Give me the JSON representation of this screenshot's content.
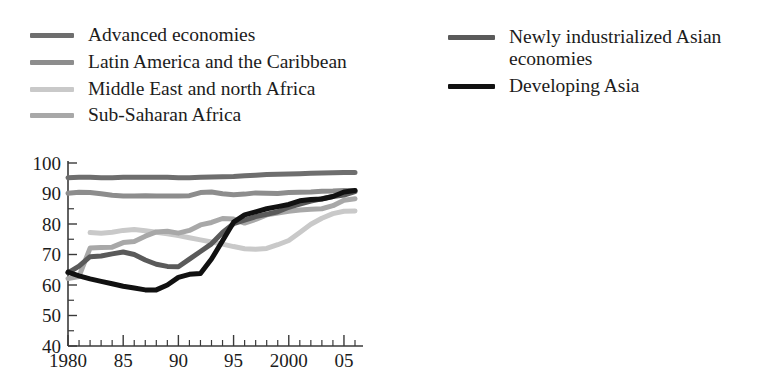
{
  "figure": {
    "title_fragment": "",
    "caption": ""
  },
  "legend": {
    "left_column": [
      {
        "label": "Advanced economies",
        "color": "#6e6e6e",
        "key": "advanced-economies"
      },
      {
        "label": "Latin America and the Caribbean",
        "color": "#8d8d8d",
        "key": "latin-america-caribbean"
      },
      {
        "label": "Middle East and north Africa",
        "color": "#c9c9c9",
        "key": "middle-east-north-africa"
      },
      {
        "label": "Sub-Saharan Africa",
        "color": "#a8a8a8",
        "key": "sub-saharan-africa"
      }
    ],
    "right_column": [
      {
        "label": "Newly industrialized Asian economies",
        "color": "#5a5a5a",
        "key": "newly-industrialized-asian-economies"
      },
      {
        "label": "Developing Asia",
        "color": "#111111",
        "key": "developing-asia"
      }
    ]
  },
  "chart_data": {
    "type": "line",
    "title": "",
    "xlabel": "",
    "ylabel": "",
    "xlim": [
      1980,
      2006
    ],
    "ylim": [
      40,
      100
    ],
    "ytick_labels": [
      "100",
      "90",
      "80",
      "70",
      "60",
      "50",
      "40"
    ],
    "ytick_values": [
      100,
      90,
      80,
      70,
      60,
      50,
      40
    ],
    "yminor_step": 5,
    "xtick_labels": [
      "1980",
      "85",
      "90",
      "95",
      "2000",
      "05"
    ],
    "xtick_values": [
      1980,
      1985,
      1990,
      1995,
      2000,
      2005
    ],
    "xminor_step": 1,
    "grid": false,
    "legend_position": "above-plot",
    "x": [
      1980,
      1981,
      1982,
      1983,
      1984,
      1985,
      1986,
      1987,
      1988,
      1989,
      1990,
      1991,
      1992,
      1993,
      1994,
      1995,
      1996,
      1997,
      1998,
      1999,
      2000,
      2001,
      2002,
      2003,
      2004,
      2005,
      2006
    ],
    "series": [
      {
        "name": "Advanced economies",
        "color": "#6e6e6e",
        "width": 5,
        "values": [
          95.2,
          95.3,
          95.3,
          95.2,
          95.2,
          95.3,
          95.3,
          95.3,
          95.3,
          95.3,
          95.2,
          95.2,
          95.3,
          95.4,
          95.5,
          95.6,
          95.8,
          96.0,
          96.2,
          96.3,
          96.4,
          96.5,
          96.6,
          96.7,
          96.8,
          96.9,
          96.9
        ]
      },
      {
        "name": "Latin America and the Caribbean",
        "color": "#8d8d8d",
        "width": 5,
        "values": [
          90.1,
          90.4,
          90.3,
          89.9,
          89.4,
          89.2,
          89.2,
          89.3,
          89.2,
          89.2,
          89.2,
          89.3,
          90.3,
          90.5,
          89.9,
          89.6,
          89.8,
          90.2,
          90.1,
          90.0,
          90.3,
          90.4,
          90.5,
          90.7,
          90.8,
          91.0,
          91.0
        ]
      },
      {
        "name": "Middle East and north Africa",
        "color": "#c9c9c9",
        "width": 5,
        "values": [
          null,
          null,
          77.2,
          77.0,
          77.3,
          77.9,
          78.2,
          77.8,
          77.3,
          76.8,
          76.2,
          75.5,
          74.8,
          74.1,
          73.4,
          72.6,
          71.9,
          71.7,
          72.0,
          73.2,
          74.6,
          77.2,
          79.9,
          81.9,
          83.4,
          84.2,
          84.3
        ]
      },
      {
        "name": "Sub-Saharan Africa",
        "color": "#a8a8a8",
        "width": 5,
        "values": [
          62.1,
          62.8,
          72.1,
          72.3,
          72.4,
          73.9,
          74.3,
          76.0,
          77.4,
          77.6,
          77.0,
          77.9,
          79.7,
          80.5,
          81.8,
          81.6,
          80.3,
          81.5,
          83.0,
          83.6,
          84.2,
          84.6,
          84.8,
          85.0,
          86.0,
          87.8,
          88.3
        ]
      },
      {
        "name": "Newly industrialized Asian economies",
        "color": "#5a5a5a",
        "width": 5,
        "values": [
          64.0,
          66.2,
          69.3,
          69.5,
          70.2,
          70.8,
          70.0,
          68.2,
          66.8,
          66.1,
          66.0,
          68.5,
          71.0,
          73.5,
          77.2,
          80.1,
          81.3,
          82.4,
          83.2,
          84.0,
          85.5,
          86.5,
          87.5,
          88.3,
          89.0,
          89.5,
          90.6
        ]
      },
      {
        "name": "Developing Asia",
        "color": "#111111",
        "width": 5,
        "values": [
          64.2,
          63.0,
          62.0,
          61.2,
          60.4,
          59.6,
          59.0,
          58.4,
          58.4,
          60.0,
          62.5,
          63.5,
          63.8,
          68.5,
          74.5,
          80.6,
          83.0,
          84.0,
          85.0,
          85.7,
          86.4,
          87.6,
          88.0,
          88.2,
          89.0,
          90.5,
          91.0
        ]
      }
    ]
  }
}
